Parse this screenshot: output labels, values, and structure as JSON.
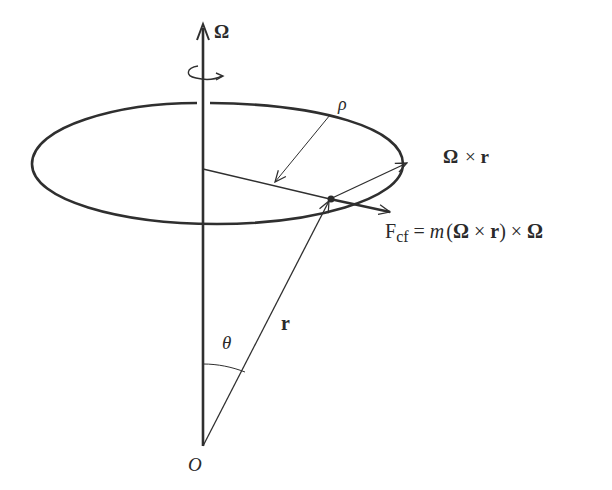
{
  "diagram": {
    "labels": {
      "omega_axis": "Ω",
      "rho": "ρ",
      "omega_cross_r": "Ω × r",
      "force_prefix": "F",
      "force_sub": "cf",
      "force_eq": " = ",
      "force_m": "m",
      "force_rest_1": "(",
      "force_omega_1": "Ω",
      "force_times_1": " × ",
      "force_r": "r",
      "force_rest_2": ") × ",
      "force_omega_2": "Ω",
      "position_vector": "r",
      "theta": "θ",
      "origin": "O"
    },
    "colors": {
      "stroke": "#2f2f2f",
      "text": "#2a2a2a",
      "background": "#ffffff"
    }
  }
}
